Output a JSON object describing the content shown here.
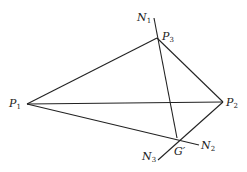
{
  "figure": {
    "points": {
      "P1": {
        "label": "P",
        "sub": "1"
      },
      "P2": {
        "label": "P",
        "sub": "2"
      },
      "P3": {
        "label": "P",
        "sub": "3"
      },
      "G": {
        "label": "G′"
      }
    },
    "lines": {
      "N1": {
        "label": "N",
        "sub": "1"
      },
      "N2": {
        "label": "N",
        "sub": "2"
      },
      "N3": {
        "label": "N",
        "sub": "3"
      }
    }
  }
}
